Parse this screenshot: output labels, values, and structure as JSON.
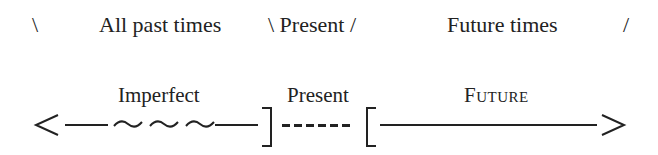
{
  "top_row": {
    "left_slash": "\\",
    "past_label": "All past times",
    "present_label": "\\ Present /",
    "future_label": "Future times",
    "right_slash": "/"
  },
  "timeline": {
    "labels": {
      "imperfect": "Imperfect",
      "present": "Present",
      "future": "Future"
    },
    "segments": [
      {
        "name": "past",
        "style": "solid-wavy-solid",
        "marker_start": "<"
      },
      {
        "name": "present",
        "style": "dashed",
        "bounds": "] ["
      },
      {
        "name": "future",
        "style": "solid",
        "marker_end": ">"
      }
    ],
    "tilde_count": 3,
    "dash_count": 6
  }
}
